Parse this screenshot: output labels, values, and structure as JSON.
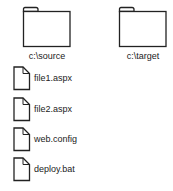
{
  "folders": [
    {
      "label": "c:\\source",
      "icon": "folder-icon"
    },
    {
      "label": "c:\\target",
      "icon": "folder-icon"
    }
  ],
  "files": [
    {
      "label": "file1.aspx",
      "icon": "file-icon"
    },
    {
      "label": "file2.aspx",
      "icon": "file-icon"
    },
    {
      "label": "web.config",
      "icon": "file-icon"
    },
    {
      "label": "deploy.bat",
      "icon": "file-icon"
    }
  ],
  "colors": {
    "stroke": "#222222",
    "background": "#ffffff"
  }
}
